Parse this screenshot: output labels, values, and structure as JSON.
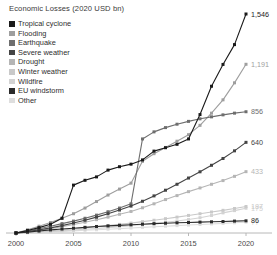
{
  "chart_data": {
    "type": "line",
    "title": "Economic Losses (2020 USD bn)",
    "xlabel": "",
    "ylabel": "",
    "grid": false,
    "legend_position": "top-left",
    "xlim": [
      2000,
      2020
    ],
    "ylim": [
      0,
      1546
    ],
    "x": [
      2000,
      2001,
      2002,
      2003,
      2004,
      2005,
      2006,
      2007,
      2008,
      2009,
      2010,
      2011,
      2012,
      2013,
      2014,
      2015,
      2016,
      2017,
      2018,
      2019,
      2020
    ],
    "xticks": [
      "2000",
      "2005",
      "2010",
      "2015",
      "2020"
    ],
    "series": [
      {
        "name": "Tropical cyclone",
        "color": "#1a1a1a",
        "end_value": "1,546",
        "values": [
          0,
          18,
          38,
          62,
          104,
          338,
          372,
          396,
          444,
          468,
          486,
          516,
          578,
          602,
          626,
          664,
          836,
          1036,
          1190,
          1330,
          1546
        ]
      },
      {
        "name": "Flooding",
        "color": "#9e9e9e",
        "end_value": "1,191",
        "values": [
          0,
          22,
          48,
          74,
          104,
          136,
          176,
          222,
          268,
          310,
          352,
          506,
          560,
          604,
          648,
          694,
          760,
          846,
          940,
          1060,
          1191
        ]
      },
      {
        "name": "Earthquake",
        "color": "#6e6e6e",
        "end_value": "856",
        "values": [
          0,
          14,
          30,
          48,
          66,
          84,
          104,
          126,
          150,
          176,
          206,
          664,
          714,
          744,
          768,
          788,
          806,
          820,
          834,
          846,
          856
        ]
      },
      {
        "name": "Severe weather",
        "color": "#444444",
        "end_value": "640",
        "values": [
          0,
          10,
          22,
          36,
          52,
          70,
          90,
          112,
          136,
          162,
          190,
          224,
          262,
          302,
          344,
          388,
          432,
          478,
          526,
          580,
          640
        ]
      },
      {
        "name": "Drought",
        "color": "#b5b5b5",
        "end_value": "433",
        "values": [
          0,
          8,
          18,
          30,
          44,
          60,
          76,
          94,
          112,
          132,
          152,
          178,
          206,
          236,
          264,
          292,
          318,
          344,
          370,
          400,
          433
        ]
      },
      {
        "name": "Winter weather",
        "color": "#c9c9c9",
        "end_value": "187",
        "values": [
          0,
          4,
          9,
          15,
          21,
          28,
          36,
          44,
          52,
          61,
          70,
          80,
          90,
          101,
          112,
          124,
          136,
          148,
          160,
          173,
          187
        ]
      },
      {
        "name": "Wildfire",
        "color": "#d3d3d3",
        "end_value": "175",
        "values": [
          0,
          3,
          6,
          10,
          15,
          20,
          26,
          32,
          38,
          45,
          52,
          60,
          68,
          76,
          85,
          95,
          108,
          124,
          142,
          158,
          175
        ]
      },
      {
        "name": "EU windstorm",
        "color": "#2b2b2b",
        "end_value": "86",
        "values": [
          0,
          6,
          14,
          22,
          28,
          34,
          40,
          46,
          50,
          54,
          58,
          62,
          66,
          69,
          72,
          74,
          77,
          79,
          81,
          84,
          86
        ]
      },
      {
        "name": "Other",
        "color": "#dedede",
        "end_value": "77",
        "values": [
          0,
          2,
          5,
          8,
          11,
          15,
          19,
          23,
          27,
          31,
          35,
          40,
          44,
          48,
          52,
          56,
          60,
          64,
          68,
          72,
          77
        ]
      }
    ]
  },
  "legend": {
    "items": [
      {
        "label": "Tropical cyclone",
        "color": "#1a1a1a"
      },
      {
        "label": "Flooding",
        "color": "#9e9e9e"
      },
      {
        "label": "Earthquake",
        "color": "#6e6e6e"
      },
      {
        "label": "Severe weather",
        "color": "#444444"
      },
      {
        "label": "Drought",
        "color": "#b5b5b5"
      },
      {
        "label": "Winter weather",
        "color": "#c9c9c9"
      },
      {
        "label": "Wildfire",
        "color": "#d3d3d3"
      },
      {
        "label": "EU windstorm",
        "color": "#2b2b2b"
      },
      {
        "label": "Other",
        "color": "#dedede"
      }
    ]
  }
}
